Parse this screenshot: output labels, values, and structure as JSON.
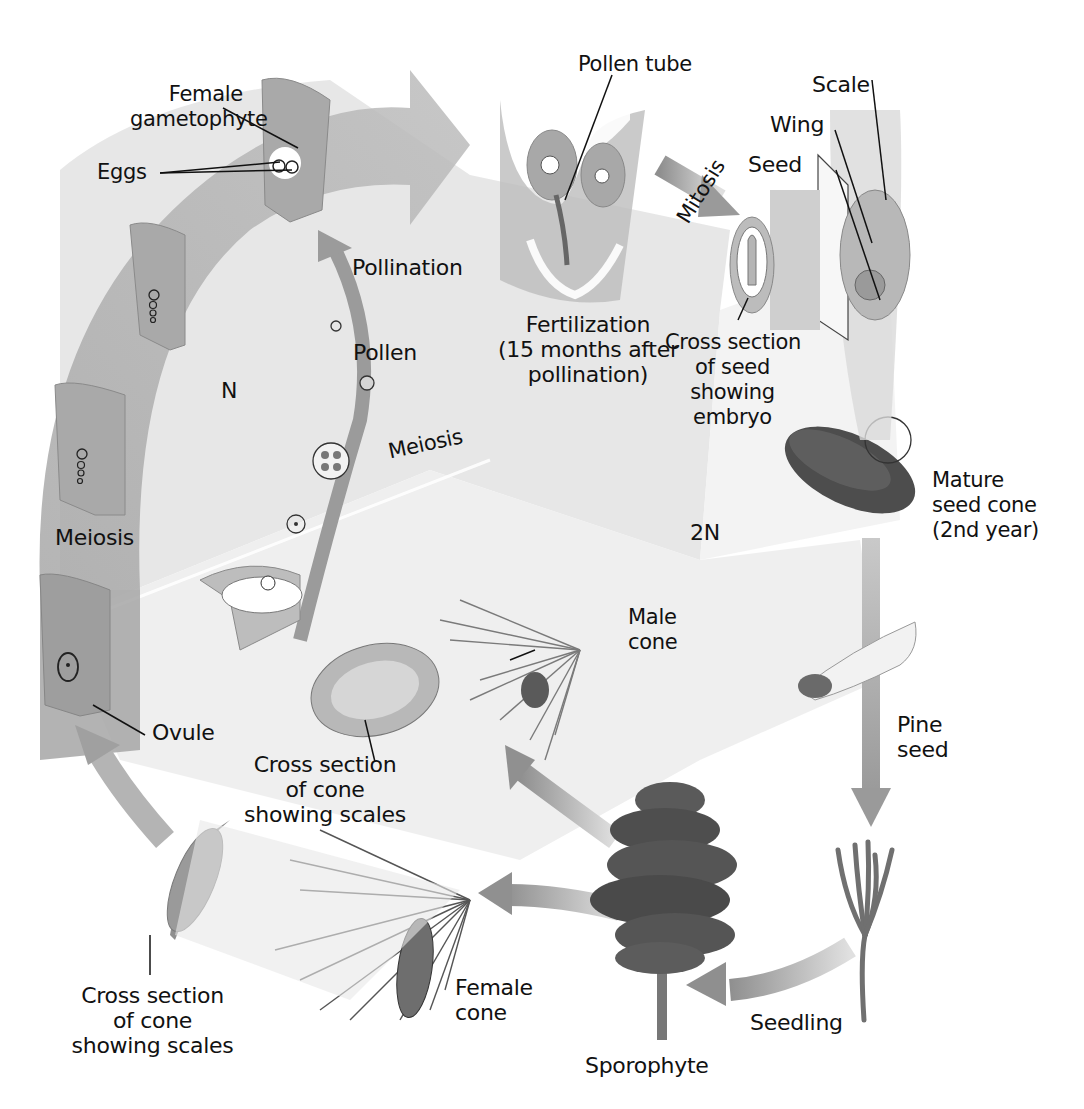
{
  "diagram": {
    "regions": {
      "haploid": "N",
      "diploid": "2N"
    },
    "labels": {
      "female_gametophyte": [
        "Female",
        "gametophyte"
      ],
      "eggs": "Eggs",
      "pollen_tube": "Pollen tube",
      "scale": "Scale",
      "wing": "Wing",
      "seed": "Seed",
      "mitosis": "Mitosis",
      "pollination": "Pollination",
      "fertilization": [
        "Fertilization",
        "(15 months after",
        "pollination)"
      ],
      "cross_section_seed": [
        "Cross section",
        "of seed",
        "showing",
        "embryo"
      ],
      "pollen": "Pollen",
      "meiosis_upper": "Meiosis",
      "meiosis_left": "Meiosis",
      "mature_seed_cone": [
        "Mature",
        "seed cone",
        "(2nd year)"
      ],
      "male_cone": [
        "Male",
        "cone"
      ],
      "ovule": "Ovule",
      "cross_section_cone_upper": [
        "Cross section",
        "of cone",
        "showing scales"
      ],
      "pine_seed": [
        "Pine",
        "seed"
      ],
      "cross_section_cone_lower": [
        "Cross section",
        "of cone",
        "showing scales"
      ],
      "female_cone": [
        "Female",
        "cone"
      ],
      "seedling": "Seedling",
      "sporophyte": "Sporophyte"
    },
    "colors": {
      "arrow_gray": "#9a9a9a",
      "haploid_bg": "#e4e4e4",
      "diploid_bg": "#efefef",
      "tissue": "#b9b9b9",
      "tree_dark": "#4a4a4a",
      "ink": "#111111"
    }
  }
}
